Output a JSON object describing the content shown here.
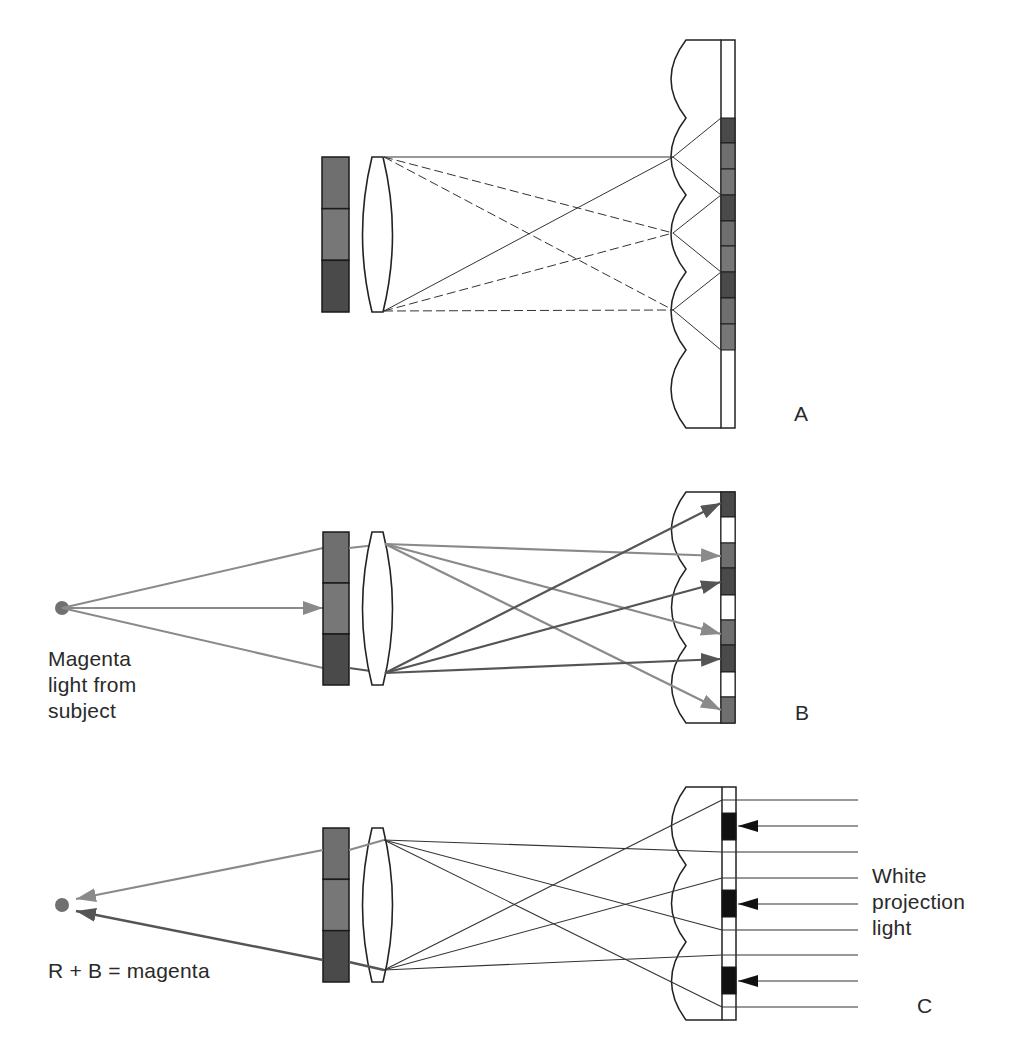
{
  "colors": {
    "outline": "#222222",
    "ray_light": "#8a8a8a",
    "ray_dark": "#555555",
    "ray_thin": "#333333",
    "filter_dark": "#4a4a4a",
    "filter_mid": "#6f6f6f",
    "filter_mid2": "#777777",
    "black": "#111111",
    "white": "#ffffff",
    "dot": "#707070"
  },
  "panels": [
    {
      "id": "A",
      "label": "A"
    },
    {
      "id": "B",
      "label": "B"
    },
    {
      "id": "C",
      "label": "C"
    }
  ],
  "labels": {
    "panel_a": "A",
    "panel_b": "B",
    "panel_c": "C",
    "b_source": [
      "Magenta",
      "light from",
      "subject"
    ],
    "c_result": "R + B = magenta",
    "c_projection": [
      "White",
      "projection",
      "light"
    ]
  },
  "geometry": {
    "A": {
      "filter": {
        "x": 322,
        "y": 157,
        "w": 27,
        "h": 155,
        "segments": [
          "mid",
          "mid2",
          "dark"
        ]
      },
      "lens": {
        "x": 362,
        "y": 157,
        "w": 31,
        "h": 155
      },
      "lenticular": {
        "top": 40,
        "bottom": 428,
        "vertex_x": 672,
        "cusp_x": 686,
        "strip_x": 721,
        "strip_w": 14,
        "vertices": [
          157,
          233,
          310
        ],
        "cusps": [
          118,
          195,
          272,
          350
        ]
      },
      "strip_segments": [
        {
          "y": 118,
          "h": 25,
          "c": "dark"
        },
        {
          "y": 143,
          "h": 26,
          "c": "mid"
        },
        {
          "y": 169,
          "h": 26,
          "c": "mid2"
        },
        {
          "y": 195,
          "h": 26,
          "c": "dark"
        },
        {
          "y": 221,
          "h": 25,
          "c": "mid"
        },
        {
          "y": 246,
          "h": 26,
          "c": "mid2"
        },
        {
          "y": 272,
          "h": 26,
          "c": "dark"
        },
        {
          "y": 298,
          "h": 26,
          "c": "mid"
        },
        {
          "y": 324,
          "h": 26,
          "c": "mid2"
        }
      ]
    },
    "B": {
      "filter": {
        "x": 323,
        "y": 532,
        "w": 26,
        "h": 153,
        "segments": [
          "mid",
          "mid2",
          "dark"
        ]
      },
      "lens": {
        "x": 362,
        "y": 532,
        "w": 31,
        "h": 153
      },
      "source_dot": {
        "cx": 62,
        "cy": 608,
        "r": 7
      },
      "lenticular": {
        "top": 492,
        "bottom": 723,
        "vertex_x": 673,
        "cusp_x": 686,
        "strip_x": 721,
        "strip_w": 14,
        "vertices": [
          530,
          608,
          685
        ],
        "cusps": [
          569,
          646
        ]
      },
      "strip_segments": [
        {
          "y": 492,
          "h": 25,
          "c": "dark"
        },
        {
          "y": 517,
          "h": 26,
          "c": "white"
        },
        {
          "y": 543,
          "h": 25,
          "c": "mid"
        },
        {
          "y": 568,
          "h": 27,
          "c": "dark"
        },
        {
          "y": 595,
          "h": 25,
          "c": "white"
        },
        {
          "y": 620,
          "h": 25,
          "c": "mid"
        },
        {
          "y": 645,
          "h": 27,
          "c": "dark"
        },
        {
          "y": 672,
          "h": 25,
          "c": "white"
        },
        {
          "y": 697,
          "h": 26,
          "c": "mid"
        }
      ]
    },
    "C": {
      "filter": {
        "x": 323,
        "y": 828,
        "w": 26,
        "h": 154,
        "segments": [
          "mid",
          "mid2",
          "dark"
        ]
      },
      "lens": {
        "x": 362,
        "y": 828,
        "w": 31,
        "h": 154
      },
      "result_dot": {
        "cx": 62,
        "cy": 905,
        "r": 7
      },
      "lenticular": {
        "top": 787,
        "bottom": 1020,
        "vertex_x": 673,
        "cusp_x": 686,
        "strip_x": 722,
        "strip_w": 14,
        "vertices": [
          826,
          904,
          981
        ],
        "cusps": [
          865,
          942
        ]
      },
      "black_blocks": [
        813,
        890,
        967
      ],
      "projection_lines": [
        800,
        826,
        852,
        878,
        904,
        930,
        955,
        981,
        1007
      ],
      "arrow_lines": [
        826,
        904,
        981
      ],
      "line_end_x": 858
    }
  }
}
